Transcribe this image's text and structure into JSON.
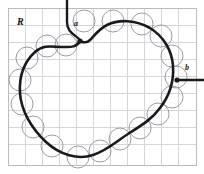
{
  "figure": {
    "type": "diagram",
    "region_label": "R",
    "labels": [
      {
        "id": "a",
        "text": "a",
        "x": 74,
        "y": 26,
        "marker_x": 80,
        "marker_y": 41
      },
      {
        "id": "b",
        "text": "b",
        "x": 185,
        "y": 70,
        "marker_x": 177,
        "marker_y": 80
      }
    ],
    "colors": {
      "background": "#ffffff",
      "frame": "#b9bcc2",
      "grid": "#d3d7dd",
      "boundary": "#1a1a1a",
      "circle": "#9a9da3",
      "arrow": "#1a1a1a",
      "label_text": "#111111"
    },
    "frame": {
      "x": 8,
      "y": 8,
      "width": 188,
      "height": 157
    },
    "grid": {
      "cell": 17,
      "cols": 11,
      "rows": 9,
      "visible": true
    },
    "boundary_path": "M 80 41 C 76 48 70 47 63 47 C 52 47 44 44 35 52 C 24 62 19 77 20 93 C 21 110 31 128 46 142 C 60 155 78 160 93 155 C 108 150 118 140 131 132 C 142 125 152 119 160 108 C 170 95 174 80 173 66 C 172 50 163 36 150 28 C 136 20 119 19 107 25 C 99 29 94 36 90 40 C 86 44 83 42 80 41 Z",
    "leader_a_path": "M 67 0 L 67 22 C 67 32 74 34 79 39",
    "leader_b_path": "M 204 80 L 179 80",
    "circles": [
      {
        "cx": 84,
        "cy": 21,
        "r": 11
      },
      {
        "cx": 113,
        "cy": 21,
        "r": 11
      },
      {
        "cx": 142,
        "cy": 24,
        "r": 11
      },
      {
        "cx": 161,
        "cy": 36,
        "r": 11
      },
      {
        "cx": 172,
        "cy": 56,
        "r": 11
      },
      {
        "cx": 176,
        "cy": 77,
        "r": 11
      },
      {
        "cx": 172,
        "cy": 97,
        "r": 11
      },
      {
        "cx": 158,
        "cy": 114,
        "r": 11
      },
      {
        "cx": 140,
        "cy": 128,
        "r": 11
      },
      {
        "cx": 120,
        "cy": 139,
        "r": 11
      },
      {
        "cx": 100,
        "cy": 151,
        "r": 11
      },
      {
        "cx": 78,
        "cy": 157,
        "r": 11
      },
      {
        "cx": 52,
        "cy": 146,
        "r": 11
      },
      {
        "cx": 33,
        "cy": 127,
        "r": 11
      },
      {
        "cx": 22,
        "cy": 104,
        "r": 11
      },
      {
        "cx": 20,
        "cy": 80,
        "r": 11
      },
      {
        "cx": 27,
        "cy": 58,
        "r": 11
      },
      {
        "cx": 47,
        "cy": 46,
        "r": 11
      },
      {
        "cx": 66,
        "cy": 45,
        "r": 11
      }
    ]
  }
}
